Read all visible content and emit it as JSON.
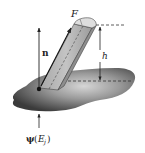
{
  "diagram": {
    "labels": {
      "force": "F",
      "normal": "n",
      "height": "h",
      "psi": "ψ",
      "psi_arg_open": "(",
      "psi_arg_E": "E",
      "psi_arg_sub": "j",
      "psi_arg_close": ")"
    },
    "colors": {
      "surface_dark": "#3a3a3a",
      "surface_light": "#c8c8c8",
      "prism_fill": "#b9b9b9",
      "prism_top": "#dcdcdc",
      "prism_side": "#9a9a9a",
      "line": "#222222"
    }
  }
}
